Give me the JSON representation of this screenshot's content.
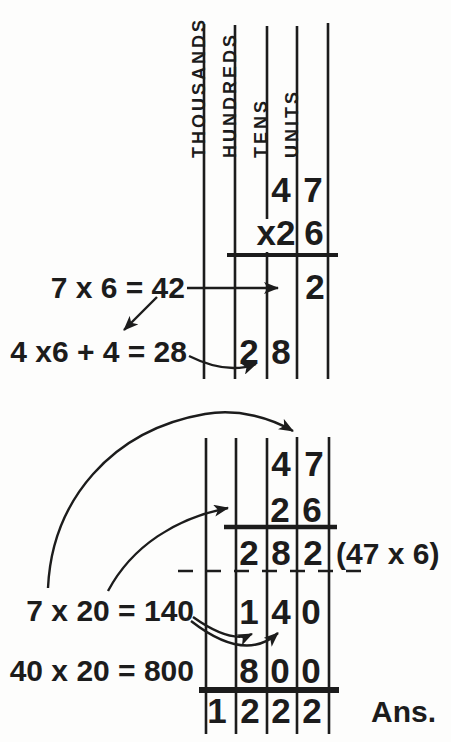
{
  "palette": {
    "ink": "#1c1c1c",
    "paper": "#fdfdfc"
  },
  "columns": {
    "thousands": "THOUSANDS",
    "hundreds": "HUNDREDS",
    "tens": "TENS",
    "units": "UNITS"
  },
  "top": {
    "multiplicand": {
      "tens": "4",
      "units": "7"
    },
    "multiplier": {
      "tens": "x2",
      "units": "6"
    },
    "partial_units_row": {
      "units": "2"
    },
    "partial_tens_row": {
      "hundreds": "2",
      "tens": "8"
    },
    "note_units": "7 x 6 = 42",
    "note_tens": "4 x6 + 4 = 28"
  },
  "bottom": {
    "multiplicand": {
      "tens": "4",
      "units": "7"
    },
    "multiplier": {
      "tens": "2",
      "units": "6"
    },
    "partial1": {
      "hundreds": "2",
      "tens": "8",
      "units": "2"
    },
    "partial1_note": "(47 x 6)",
    "partial2": {
      "hundreds": "1",
      "tens": "4",
      "units": "0"
    },
    "note_7x20": "7 x 20 = 140",
    "partial3": {
      "hundreds": "8",
      "tens": "0",
      "units": "0"
    },
    "note_40x20": "40 x 20 = 800",
    "answer": {
      "thousands": "1",
      "hundreds": "2",
      "tens": "2",
      "units": "2"
    },
    "answer_label": "Ans."
  }
}
